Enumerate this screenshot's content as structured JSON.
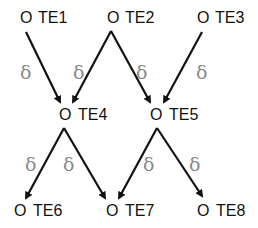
{
  "diagram": {
    "nodes": [
      {
        "id": "TE1",
        "marker": "O",
        "label": "TE1",
        "x": 26,
        "y": 22
      },
      {
        "id": "TE2",
        "marker": "O",
        "label": "TE2",
        "x": 113,
        "y": 22
      },
      {
        "id": "TE3",
        "marker": "O",
        "label": "TE3",
        "x": 203,
        "y": 22
      },
      {
        "id": "TE4",
        "marker": "O",
        "label": "TE4",
        "x": 64,
        "y": 120
      },
      {
        "id": "TE5",
        "marker": "O",
        "label": "TE5",
        "x": 156,
        "y": 120
      },
      {
        "id": "TE6",
        "marker": "O",
        "label": "TE6",
        "x": 19,
        "y": 216
      },
      {
        "id": "TE7",
        "marker": "O",
        "label": "TE7",
        "x": 112,
        "y": 216
      },
      {
        "id": "TE8",
        "marker": "O",
        "label": "TE8",
        "x": 203,
        "y": 216
      }
    ],
    "edges": [
      {
        "from": "TE1",
        "to": "TE4",
        "label": "δ"
      },
      {
        "from": "TE2",
        "to": "TE4",
        "label": "δ"
      },
      {
        "from": "TE2",
        "to": "TE5",
        "label": "δ"
      },
      {
        "from": "TE3",
        "to": "TE5",
        "label": "δ"
      },
      {
        "from": "TE4",
        "to": "TE6",
        "label": "δ"
      },
      {
        "from": "TE4",
        "to": "TE7",
        "label": "δ"
      },
      {
        "from": "TE5",
        "to": "TE7",
        "label": "δ"
      },
      {
        "from": "TE5",
        "to": "TE8",
        "label": "δ"
      }
    ],
    "edge_label": "δ",
    "colors": {
      "line": "#111111",
      "delta": "#8a8a8a",
      "text": "#111111"
    }
  }
}
